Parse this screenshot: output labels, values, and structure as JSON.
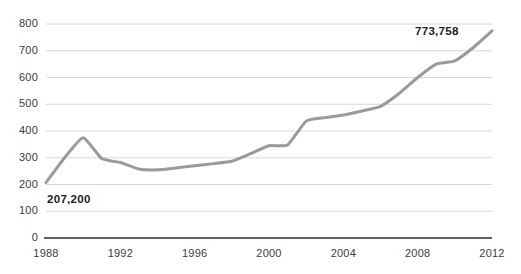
{
  "chart_data": {
    "type": "line",
    "title": "",
    "subtitle": "",
    "xlabel": "",
    "ylabel": "",
    "x": [
      1988,
      1989,
      1990,
      1991,
      1992,
      1993,
      1994,
      1995,
      1996,
      1997,
      1998,
      1999,
      2000,
      2001,
      2002,
      2003,
      2004,
      2005,
      2006,
      2007,
      2008,
      2009,
      2010,
      2011,
      2012
    ],
    "values": [
      207,
      300,
      375,
      297,
      282,
      258,
      255,
      262,
      270,
      278,
      287,
      315,
      345,
      348,
      437,
      450,
      460,
      475,
      492,
      540,
      600,
      650,
      662,
      712,
      774
    ],
    "series": [
      {
        "name": "value",
        "values": [
          207,
          300,
          375,
          297,
          282,
          258,
          255,
          262,
          270,
          278,
          287,
          315,
          345,
          348,
          437,
          450,
          460,
          475,
          492,
          540,
          600,
          650,
          662,
          712,
          774
        ]
      }
    ],
    "xlim": [
      1988,
      2012
    ],
    "ylim": [
      0,
      800
    ],
    "grid": "horizontal",
    "legend": "none",
    "line_color": "#9a9a9a",
    "line_width": 3,
    "gridline_color": "#d8d8d8",
    "axis_color": "#2b2b2b",
    "background": "#ffffff",
    "y_ticks": [
      "0",
      "100",
      "200",
      "300",
      "400",
      "500",
      "600",
      "700",
      "800"
    ],
    "y_tick_values": [
      0,
      100,
      200,
      300,
      400,
      500,
      600,
      700,
      800
    ],
    "x_ticks": [
      "1988",
      "1992",
      "1996",
      "2000",
      "2004",
      "2008",
      "2012"
    ],
    "x_tick_values": [
      1988,
      1992,
      1996,
      2000,
      2004,
      2008,
      2012
    ],
    "annotations": [
      {
        "name": "start-value-label",
        "text": "207,200",
        "x": 1988,
        "y": 207
      },
      {
        "name": "end-value-label",
        "text": "773,758",
        "x": 2012,
        "y": 774
      }
    ]
  }
}
